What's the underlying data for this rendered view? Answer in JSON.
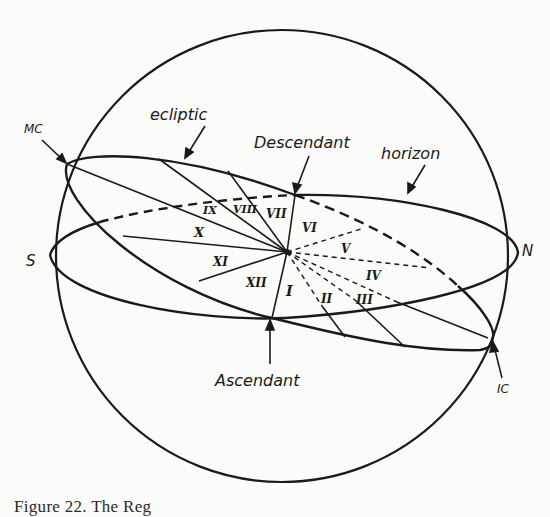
{
  "figure": {
    "caption": "Figure 22. The Reg",
    "colors": {
      "ink": "#1a1a1a",
      "paper": "#fbfbf9"
    }
  },
  "labels": {
    "mc": "MC",
    "ic": "IC",
    "ecliptic": "ecliptic",
    "horizon": "horizon",
    "descendant": "Descendant",
    "ascendant": "Ascendant",
    "south": "S",
    "north": "N"
  },
  "houses": [
    {
      "numeral": "I"
    },
    {
      "numeral": "II"
    },
    {
      "numeral": "III"
    },
    {
      "numeral": "IV"
    },
    {
      "numeral": "V"
    },
    {
      "numeral": "VI"
    },
    {
      "numeral": "VII"
    },
    {
      "numeral": "VIII"
    },
    {
      "numeral": "IX"
    },
    {
      "numeral": "X"
    },
    {
      "numeral": "XI"
    },
    {
      "numeral": "XII"
    }
  ]
}
